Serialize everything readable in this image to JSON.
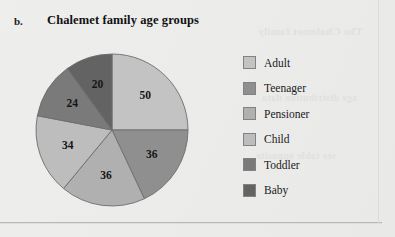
{
  "figure": {
    "item_label": "b.",
    "title": "Chalemet family age groups",
    "background_color": "#ededec",
    "rule_color": "#b9b9b7"
  },
  "ghost_text": {
    "line1": "The Chalemet family",
    "line2": "age distribution data",
    "line3": "see table opposite"
  },
  "legend": {
    "items": [
      {
        "label": "Adult",
        "color": "#c3c3c3"
      },
      {
        "label": "Teenager",
        "color": "#8f8f8f"
      },
      {
        "label": "Pensioner",
        "color": "#b0b0b0"
      },
      {
        "label": "Child",
        "color": "#bdbdbd"
      },
      {
        "label": "Toddler",
        "color": "#7a7a7a"
      },
      {
        "label": "Baby",
        "color": "#636363"
      }
    ]
  },
  "chart_data": {
    "type": "pie",
    "title": "Chalemet family age groups",
    "categories": [
      "Adult",
      "Teenager",
      "Pensioner",
      "Child",
      "Toddler",
      "Baby"
    ],
    "values": [
      50,
      36,
      36,
      34,
      24,
      20
    ],
    "data_labels": [
      "50",
      "36",
      "36",
      "34",
      "24",
      "20"
    ],
    "total": 200,
    "start_angle_deg": 0,
    "direction": "clockwise",
    "slice_colors": [
      "#c3c3c3",
      "#8f8f8f",
      "#b0b0b0",
      "#bdbdbd",
      "#7a7a7a",
      "#636363"
    ],
    "slice_outline_color": "#6d6d6d",
    "legend_position": "right",
    "grid": false,
    "xlabel": "",
    "ylabel": ""
  }
}
